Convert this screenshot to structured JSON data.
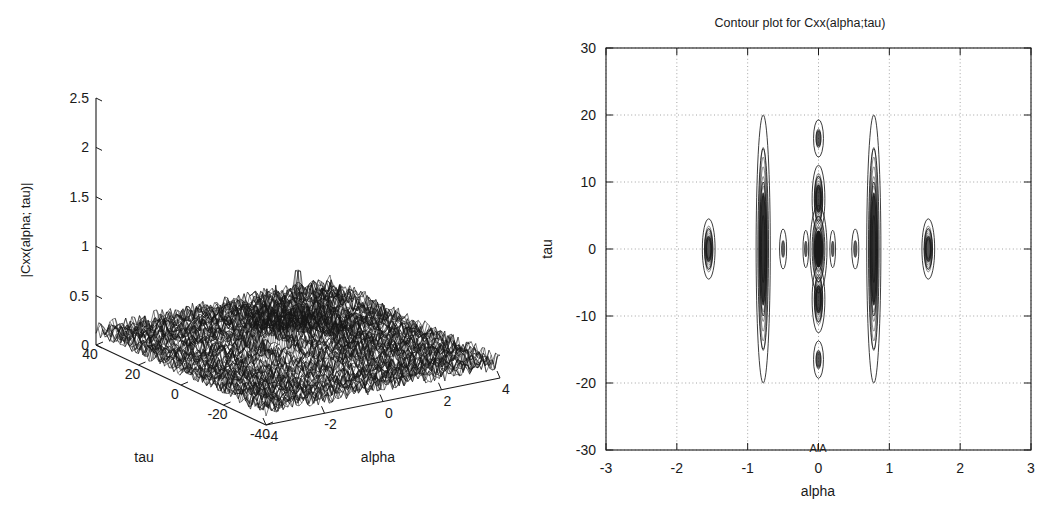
{
  "figure": {
    "background": "#ffffff",
    "ink": "#1a1a1a",
    "grid_color": "#9a9a9a"
  },
  "surface_plot": {
    "name": "3D mesh surface of cyclic autocorrelation magnitude",
    "zlabel": "|Cxx(alpha; tau)|",
    "xlabel": "alpha",
    "ylabel": "tau",
    "z_ticks": [
      "0",
      "0.5",
      "1",
      "1.5",
      "2",
      "2.5"
    ],
    "z_tick_values": [
      0,
      0.5,
      1,
      1.5,
      2,
      2.5
    ],
    "tau_ticks": [
      "40",
      "20",
      "0",
      "-20",
      "-40"
    ],
    "tau_tick_values": [
      40,
      20,
      0,
      -20,
      -40
    ],
    "alpha_ticks": [
      "-4",
      "-2",
      "0",
      "2",
      "4"
    ],
    "alpha_tick_values": [
      -4,
      -2,
      0,
      2,
      4
    ]
  },
  "contour_plot": {
    "name": "Contour plot of cyclic autocorrelation",
    "title": "Contour plot for Cxx(alpha;tau)",
    "xlabel": "alpha",
    "ylabel": "tau",
    "x_ticks": [
      "-3",
      "-2",
      "-1",
      "0",
      "1",
      "2",
      "3"
    ],
    "x_tick_values": [
      -3,
      -2,
      -1,
      0,
      1,
      2,
      3
    ],
    "y_ticks": [
      "30",
      "20",
      "10",
      "0",
      "-10",
      "-20",
      "-30"
    ],
    "y_tick_values": [
      30,
      20,
      10,
      0,
      -10,
      -20,
      -30
    ],
    "artifact_text": "AlA"
  },
  "chart_data": {
    "type": "contour",
    "title": "Contour plot for Cxx(alpha;tau)",
    "xlabel": "alpha",
    "ylabel": "tau",
    "xlim": [
      -3,
      3
    ],
    "ylim": [
      -30,
      30
    ],
    "grid": true,
    "legend": "none",
    "features": [
      {
        "alpha": -1.55,
        "tau": 0,
        "tau_extent": 4.5,
        "alpha_extent": 0.09,
        "levels": 3,
        "intensity": 0.45
      },
      {
        "alpha": -0.78,
        "tau": 0,
        "tau_extent": 20.0,
        "alpha_extent": 0.1,
        "levels": 4,
        "intensity": 0.8
      },
      {
        "alpha": -0.5,
        "tau": 0,
        "tau_extent": 3.0,
        "alpha_extent": 0.05,
        "levels": 1,
        "intensity": 0.3
      },
      {
        "alpha": -0.18,
        "tau": 0,
        "tau_extent": 2.8,
        "alpha_extent": 0.04,
        "levels": 1,
        "intensity": 0.3
      },
      {
        "alpha": 0.0,
        "tau": 0,
        "tau_extent": 6.5,
        "alpha_extent": 0.12,
        "levels": 4,
        "intensity": 1.0
      },
      {
        "alpha": 0.0,
        "tau": 7.5,
        "tau_extent": 5.0,
        "alpha_extent": 0.09,
        "levels": 3,
        "intensity": 0.6
      },
      {
        "alpha": 0.0,
        "tau": -7.5,
        "tau_extent": 5.0,
        "alpha_extent": 0.09,
        "levels": 3,
        "intensity": 0.6
      },
      {
        "alpha": 0.0,
        "tau": 16.5,
        "tau_extent": 2.8,
        "alpha_extent": 0.07,
        "levels": 2,
        "intensity": 0.4
      },
      {
        "alpha": 0.0,
        "tau": -16.5,
        "tau_extent": 2.8,
        "alpha_extent": 0.07,
        "levels": 2,
        "intensity": 0.4
      },
      {
        "alpha": 0.2,
        "tau": 0,
        "tau_extent": 2.8,
        "alpha_extent": 0.04,
        "levels": 1,
        "intensity": 0.3
      },
      {
        "alpha": 0.52,
        "tau": 0,
        "tau_extent": 3.0,
        "alpha_extent": 0.05,
        "levels": 1,
        "intensity": 0.3
      },
      {
        "alpha": 0.78,
        "tau": 0,
        "tau_extent": 20.0,
        "alpha_extent": 0.1,
        "levels": 4,
        "intensity": 0.8
      },
      {
        "alpha": 1.55,
        "tau": 0,
        "tau_extent": 4.5,
        "alpha_extent": 0.09,
        "levels": 3,
        "intensity": 0.45
      }
    ]
  },
  "surface_data": {
    "type": "mesh3d",
    "zlabel": "|Cxx(alpha; tau)|",
    "xlabel": "alpha",
    "ylabel": "tau",
    "zlim": [
      0,
      2.5
    ],
    "alpha_lim": [
      -4,
      4
    ],
    "tau_lim": [
      -40,
      40
    ],
    "noise_floor": 0.18,
    "peaks": [
      {
        "alpha": 0.0,
        "tau": 0.0,
        "height": 2.0
      },
      {
        "alpha": -0.78,
        "tau": 0.0,
        "height": 0.72
      },
      {
        "alpha": 0.78,
        "tau": 0.0,
        "height": 0.62
      },
      {
        "alpha": -1.55,
        "tau": 0.0,
        "height": 0.4
      },
      {
        "alpha": 1.55,
        "tau": 0.0,
        "height": 0.38
      }
    ]
  }
}
